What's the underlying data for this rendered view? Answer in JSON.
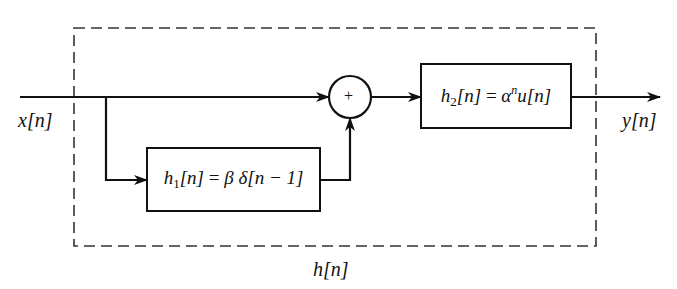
{
  "diagram": {
    "type": "block-diagram",
    "input_signal": {
      "label": "x[n]"
    },
    "output_signal": {
      "label": "y[n]"
    },
    "overall_system": {
      "label": "h[n]",
      "border_style": "dashed"
    },
    "blocks": [
      {
        "id": "h1",
        "label": "h1[n] = β δ[n − 1]",
        "name": "h",
        "subscript": "1",
        "arg": "[n]",
        "equals": "=",
        "expr_beta": "β",
        "expr_delta": "δ",
        "expr_arg": "[n − 1]"
      },
      {
        "id": "h2",
        "label": "h2[n] = αⁿu[n]",
        "name": "h",
        "subscript": "2",
        "arg": "[n]",
        "equals": "=",
        "expr_alpha": "α",
        "expr_power": "n",
        "expr_u": "u",
        "expr_arg": "[n]"
      }
    ],
    "summing_junction": {
      "symbol": "+"
    },
    "connections": [
      {
        "from": "x[n]",
        "to": "summing_junction",
        "path": "direct"
      },
      {
        "from": "x[n]",
        "to": "h1",
        "path": "branch down"
      },
      {
        "from": "h1",
        "to": "summing_junction",
        "path": "up into bottom"
      },
      {
        "from": "summing_junction",
        "to": "h2"
      },
      {
        "from": "h2",
        "to": "y[n]"
      }
    ],
    "colors": {
      "line": "#111111",
      "background": "#ffffff",
      "dashed_border": "#333333"
    }
  }
}
